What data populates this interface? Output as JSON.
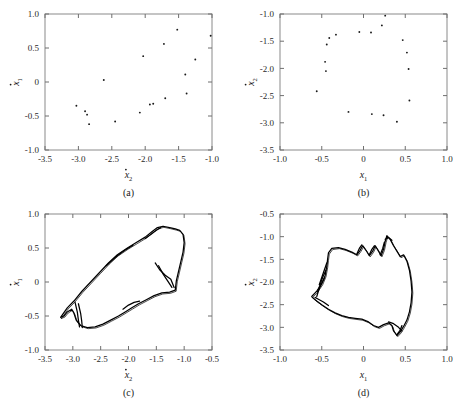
{
  "figure": {
    "background": "#ffffff",
    "ink": "#000000",
    "frame_color": "#8a8a8a"
  },
  "panels": [
    {
      "key": "a",
      "caption": "(a)",
      "xlabel_main": "x",
      "xlabel_sub": "2",
      "xlabel_dot": true,
      "ylabel_main": "x",
      "ylabel_sub": "1",
      "ylabel_dot": true,
      "xlim": [
        -3.5,
        -1.0
      ],
      "ylim": [
        -1.0,
        1.0
      ],
      "xticks": [
        "-3.5",
        "-3.0",
        "-2.5",
        "-2.0",
        "-1.5",
        "-1.0"
      ],
      "xtickvals": [
        -3.5,
        -3.0,
        -2.5,
        -2.0,
        -1.5,
        -1.0
      ],
      "yticks": [
        "-1.0",
        "-0.5",
        "0",
        "0.5",
        "1.0"
      ],
      "ytickvals": [
        -1.0,
        -0.5,
        0.0,
        0.5,
        1.0
      ]
    },
    {
      "key": "b",
      "caption": "(b)",
      "xlabel_main": "x",
      "xlabel_sub": "1",
      "xlabel_dot": false,
      "ylabel_main": "x",
      "ylabel_sub": "2",
      "ylabel_dot": true,
      "xlim": [
        -1.0,
        1.0
      ],
      "ylim": [
        -3.5,
        -1.0
      ],
      "xticks": [
        "-1.0",
        "-0.5",
        "0",
        "0.5",
        "1.0"
      ],
      "xtickvals": [
        -1.0,
        -0.5,
        0.0,
        0.5,
        1.0
      ],
      "yticks": [
        "-3.5",
        "-3.0",
        "-2.5",
        "-2.0",
        "-1.5",
        "-1.0"
      ],
      "ytickvals": [
        -3.5,
        -3.0,
        -2.5,
        -2.0,
        -1.5,
        -1.0
      ]
    },
    {
      "key": "c",
      "caption": "(c)",
      "xlabel_main": "x",
      "xlabel_sub": "2",
      "xlabel_dot": true,
      "ylabel_main": "x",
      "ylabel_sub": "1",
      "ylabel_dot": true,
      "xlim": [
        -3.5,
        -0.5
      ],
      "ylim": [
        -1.0,
        1.0
      ],
      "xticks": [
        "-3.5",
        "-3.0",
        "-2.5",
        "-2.0",
        "-1.5",
        "-1.0",
        "-0.5"
      ],
      "xtickvals": [
        -3.5,
        -3.0,
        -2.5,
        -2.0,
        -1.5,
        -1.0,
        -0.5
      ],
      "yticks": [
        "-1.0",
        "-0.5",
        "0",
        "0.5",
        "1.0"
      ],
      "ytickvals": [
        -1.0,
        -0.5,
        0.0,
        0.5,
        1.0
      ]
    },
    {
      "key": "d",
      "caption": "(d)",
      "xlabel_main": "x",
      "xlabel_sub": "1",
      "xlabel_dot": false,
      "ylabel_main": "x",
      "ylabel_sub": "2",
      "ylabel_dot": true,
      "xlim": [
        -1.0,
        1.0
      ],
      "ylim": [
        -3.5,
        -0.5
      ],
      "xticks": [
        "-1.0",
        "-0.5",
        "0",
        "0.5",
        "1.0"
      ],
      "xtickvals": [
        -1.0,
        -0.5,
        0.0,
        0.5,
        1.0
      ],
      "yticks": [
        "-3.5",
        "-3.0",
        "-2.5",
        "-2.0",
        "-1.5",
        "-1.0",
        "-0.5"
      ],
      "ytickvals": [
        -3.5,
        -3.0,
        -2.5,
        -2.0,
        -1.5,
        -1.0,
        -0.5
      ]
    }
  ],
  "chart_data": [
    {
      "type": "scatter",
      "panel": "a",
      "title": "(a)",
      "xlabel": "ẋ₂",
      "ylabel": "ẋ₁",
      "xlim": [
        -3.5,
        -1.0
      ],
      "ylim": [
        -1.0,
        1.0
      ],
      "grid": false,
      "legend": "none",
      "points": [
        [
          -3.03,
          -0.35
        ],
        [
          -2.9,
          -0.43
        ],
        [
          -2.87,
          -0.48
        ],
        [
          -2.84,
          -0.62
        ],
        [
          -2.62,
          0.03
        ],
        [
          -2.45,
          -0.58
        ],
        [
          -2.08,
          -0.45
        ],
        [
          -2.03,
          0.38
        ],
        [
          -1.93,
          -0.33
        ],
        [
          -1.88,
          -0.32
        ],
        [
          -1.72,
          0.56
        ],
        [
          -1.7,
          -0.24
        ],
        [
          -1.52,
          0.77
        ],
        [
          -1.4,
          0.11
        ],
        [
          -1.38,
          -0.17
        ],
        [
          -1.25,
          0.33
        ],
        [
          -1.02,
          0.68
        ]
      ]
    },
    {
      "type": "scatter",
      "panel": "b",
      "title": "(b)",
      "xlabel": "x₁",
      "ylabel": "ẋ₂",
      "xlim": [
        -1.0,
        1.0
      ],
      "ylim": [
        -3.5,
        -1.0
      ],
      "grid": false,
      "legend": "none",
      "points": [
        [
          -0.56,
          -2.42
        ],
        [
          -0.45,
          -2.05
        ],
        [
          -0.46,
          -1.88
        ],
        [
          -0.44,
          -1.56
        ],
        [
          -0.41,
          -1.44
        ],
        [
          -0.33,
          -1.38
        ],
        [
          -0.18,
          -2.8
        ],
        [
          -0.05,
          -1.33
        ],
        [
          0.09,
          -1.34
        ],
        [
          0.1,
          -2.84
        ],
        [
          0.22,
          -1.21
        ],
        [
          0.24,
          -2.86
        ],
        [
          0.26,
          -1.03
        ],
        [
          0.4,
          -2.98
        ],
        [
          0.47,
          -1.48
        ],
        [
          0.52,
          -1.71
        ],
        [
          0.54,
          -2.01
        ],
        [
          0.55,
          -2.59
        ]
      ]
    },
    {
      "type": "line",
      "panel": "c",
      "title": "(c)",
      "xlabel": "ẋ₂",
      "ylabel": "ẋ₁",
      "xlim": [
        -3.5,
        -0.5
      ],
      "ylim": [
        -1.0,
        1.0
      ],
      "grid": false,
      "legend": "none",
      "description": "chaotic attractor band, elongated loop with spiky protrusions on lower-left and right",
      "outer_path": [
        [
          -3.22,
          -0.52
        ],
        [
          -3.1,
          -0.38
        ],
        [
          -2.98,
          -0.28
        ],
        [
          -2.84,
          -0.14
        ],
        [
          -2.68,
          0.0
        ],
        [
          -2.52,
          0.14
        ],
        [
          -2.36,
          0.28
        ],
        [
          -2.2,
          0.4
        ],
        [
          -2.02,
          0.5
        ],
        [
          -1.86,
          0.58
        ],
        [
          -1.7,
          0.66
        ],
        [
          -1.58,
          0.74
        ],
        [
          -1.48,
          0.8
        ],
        [
          -1.38,
          0.82
        ],
        [
          -1.26,
          0.8
        ],
        [
          -1.16,
          0.78
        ],
        [
          -1.08,
          0.76
        ],
        [
          -1.02,
          0.7
        ],
        [
          -1.0,
          0.58
        ],
        [
          -1.02,
          0.44
        ],
        [
          -1.06,
          0.3
        ],
        [
          -1.1,
          0.16
        ],
        [
          -1.14,
          0.02
        ],
        [
          -1.16,
          -0.12
        ],
        [
          -1.26,
          -0.15
        ],
        [
          -1.4,
          -0.16
        ],
        [
          -1.54,
          -0.2
        ],
        [
          -1.68,
          -0.26
        ],
        [
          -1.82,
          -0.32
        ],
        [
          -1.94,
          -0.38
        ],
        [
          -2.06,
          -0.44
        ],
        [
          -2.18,
          -0.5
        ],
        [
          -2.32,
          -0.56
        ],
        [
          -2.46,
          -0.62
        ],
        [
          -2.6,
          -0.66
        ],
        [
          -2.74,
          -0.67
        ],
        [
          -2.86,
          -0.64
        ],
        [
          -2.94,
          -0.56
        ],
        [
          -2.98,
          -0.46
        ],
        [
          -3.02,
          -0.4
        ],
        [
          -3.1,
          -0.44
        ],
        [
          -3.16,
          -0.5
        ],
        [
          -3.22,
          -0.52
        ]
      ],
      "spikes": [
        [
          [
            -2.96,
            -0.3
          ],
          [
            -2.92,
            -0.44
          ],
          [
            -2.9,
            -0.56
          ],
          [
            -2.88,
            -0.66
          ]
        ],
        [
          [
            -2.9,
            -0.32
          ],
          [
            -2.86,
            -0.46
          ],
          [
            -2.84,
            -0.58
          ],
          [
            -2.83,
            -0.67
          ]
        ],
        [
          [
            -1.52,
            0.28
          ],
          [
            -1.44,
            0.18
          ],
          [
            -1.34,
            0.1
          ],
          [
            -1.24,
            0.04
          ],
          [
            -1.18,
            -0.08
          ]
        ],
        [
          [
            -1.46,
            0.24
          ],
          [
            -1.38,
            0.12
          ],
          [
            -1.3,
            0.02
          ],
          [
            -1.22,
            -0.08
          ]
        ],
        [
          [
            -2.1,
            -0.4
          ],
          [
            -2.0,
            -0.34
          ],
          [
            -1.9,
            -0.3
          ],
          [
            -1.8,
            -0.28
          ]
        ],
        [
          [
            -1.7,
            0.64
          ],
          [
            -1.6,
            0.7
          ],
          [
            -1.5,
            0.76
          ],
          [
            -1.42,
            0.8
          ]
        ],
        [
          [
            -2.4,
            0.24
          ],
          [
            -2.24,
            0.36
          ],
          [
            -2.08,
            0.46
          ],
          [
            -1.92,
            0.54
          ]
        ]
      ]
    },
    {
      "type": "line",
      "panel": "d",
      "title": "(d)",
      "xlabel": "x₁",
      "ylabel": "ẋ₂",
      "xlim": [
        -1.0,
        1.0
      ],
      "ylim": [
        -3.5,
        -0.5
      ],
      "grid": false,
      "legend": "none",
      "description": "closed chaotic attractor loop with spiky protrusions on the left and top",
      "outer_path": [
        [
          -0.62,
          -2.32
        ],
        [
          -0.56,
          -2.2
        ],
        [
          -0.5,
          -2.04
        ],
        [
          -0.46,
          -1.86
        ],
        [
          -0.44,
          -1.66
        ],
        [
          -0.43,
          -1.5
        ],
        [
          -0.42,
          -1.36
        ],
        [
          -0.38,
          -1.26
        ],
        [
          -0.3,
          -1.24
        ],
        [
          -0.22,
          -1.28
        ],
        [
          -0.14,
          -1.34
        ],
        [
          -0.08,
          -1.4
        ],
        [
          -0.04,
          -1.3
        ],
        [
          -0.01,
          -1.2
        ],
        [
          0.03,
          -1.3
        ],
        [
          0.07,
          -1.42
        ],
        [
          0.11,
          -1.32
        ],
        [
          0.14,
          -1.2
        ],
        [
          0.18,
          -1.32
        ],
        [
          0.21,
          -1.42
        ],
        [
          0.24,
          -1.28
        ],
        [
          0.26,
          -1.1
        ],
        [
          0.28,
          -0.98
        ],
        [
          0.32,
          -1.06
        ],
        [
          0.36,
          -1.2
        ],
        [
          0.4,
          -1.32
        ],
        [
          0.44,
          -1.44
        ],
        [
          0.48,
          -1.4
        ],
        [
          0.52,
          -1.54
        ],
        [
          0.55,
          -1.74
        ],
        [
          0.57,
          -1.98
        ],
        [
          0.58,
          -2.22
        ],
        [
          0.57,
          -2.46
        ],
        [
          0.55,
          -2.66
        ],
        [
          0.52,
          -2.84
        ],
        [
          0.48,
          -2.98
        ],
        [
          0.44,
          -3.1
        ],
        [
          0.4,
          -3.18
        ],
        [
          0.36,
          -3.08
        ],
        [
          0.34,
          -2.96
        ],
        [
          0.3,
          -2.9
        ],
        [
          0.24,
          -2.94
        ],
        [
          0.18,
          -3.0
        ],
        [
          0.12,
          -2.96
        ],
        [
          0.06,
          -2.88
        ],
        [
          -0.02,
          -2.82
        ],
        [
          -0.1,
          -2.8
        ],
        [
          -0.18,
          -2.78
        ],
        [
          -0.26,
          -2.74
        ],
        [
          -0.34,
          -2.68
        ],
        [
          -0.42,
          -2.6
        ],
        [
          -0.5,
          -2.5
        ],
        [
          -0.56,
          -2.42
        ],
        [
          -0.6,
          -2.36
        ],
        [
          -0.62,
          -2.32
        ]
      ],
      "spikes": [
        [
          [
            -0.47,
            -1.92
          ],
          [
            -0.51,
            -2.06
          ],
          [
            -0.54,
            -2.2
          ],
          [
            -0.56,
            -2.32
          ]
        ],
        [
          [
            -0.45,
            -1.74
          ],
          [
            -0.49,
            -1.9
          ],
          [
            -0.52,
            -2.06
          ],
          [
            -0.55,
            -2.22
          ]
        ],
        [
          [
            -0.44,
            -1.58
          ],
          [
            -0.47,
            -1.74
          ],
          [
            -0.5,
            -1.9
          ],
          [
            -0.53,
            -2.06
          ]
        ],
        [
          [
            -0.58,
            -2.34
          ],
          [
            -0.54,
            -2.38
          ],
          [
            -0.48,
            -2.44
          ],
          [
            -0.42,
            -2.52
          ]
        ],
        [
          [
            -0.08,
            -1.38
          ],
          [
            -0.05,
            -1.26
          ],
          [
            -0.02,
            -1.18
          ]
        ],
        [
          [
            0.07,
            -1.4
          ],
          [
            0.1,
            -1.28
          ],
          [
            0.13,
            -1.2
          ]
        ],
        [
          [
            0.2,
            -1.4
          ],
          [
            0.23,
            -1.26
          ],
          [
            0.25,
            -1.12
          ]
        ],
        [
          [
            0.26,
            -1.06
          ],
          [
            0.3,
            -1.02
          ],
          [
            0.34,
            -1.08
          ]
        ],
        [
          [
            0.3,
            -2.88
          ],
          [
            0.36,
            -2.92
          ],
          [
            0.42,
            -3.0
          ],
          [
            0.46,
            -3.08
          ]
        ],
        [
          [
            0.4,
            -3.16
          ],
          [
            0.44,
            -3.06
          ],
          [
            0.46,
            -2.96
          ]
        ]
      ]
    }
  ]
}
